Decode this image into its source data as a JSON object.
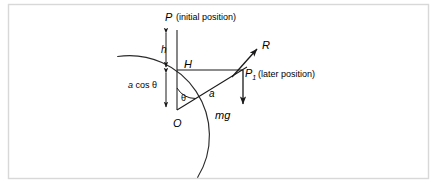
{
  "figure": {
    "type": "physics-diagram",
    "background_color": "#ffffff",
    "stroke_color": "#1a1a1a",
    "border_color": "#d8d8d8",
    "labels": {
      "apex_point": "P",
      "apex_note": "(initial position)",
      "height_drop": "h",
      "horizontal_distance": "H",
      "vertical_component": "a cos θ",
      "vertical_component_symbol": "a",
      "vertical_component_function": "cos",
      "vertical_component_angle": "θ",
      "angle": "θ",
      "radius": "a",
      "center_point": "O",
      "reaction_force": "R",
      "later_point": "P",
      "later_point_subscript": "1",
      "later_note": "(later position)",
      "weight_force": "mg"
    },
    "geometry": {
      "center": {
        "x": 177,
        "y": 110
      },
      "radius": 80,
      "apex": {
        "x": 177,
        "y": 30
      },
      "later_position": {
        "x": 243,
        "y": 70
      },
      "angle_degrees": 39,
      "arc_start_degrees": 138,
      "arc_end_degrees": 345,
      "reaction_arrow_tip": {
        "x": 258,
        "y": 48
      },
      "weight_arrow_tip": {
        "x": 243,
        "y": 105
      },
      "dimension_line_x": 166,
      "height_span": {
        "from_y": 30,
        "to_y": 70
      },
      "acos_span": {
        "from_y": 70,
        "to_y": 110
      }
    }
  }
}
